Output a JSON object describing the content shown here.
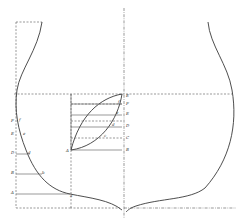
{
  "diagram": {
    "type": "geometric-construction",
    "left_labels": [
      "F",
      "E",
      "D",
      "C",
      "B",
      "A"
    ],
    "left_curve_labels": [
      "f",
      "e",
      "d",
      "c",
      "b",
      "a"
    ],
    "center_right_labels": [
      "F",
      "E",
      "D",
      "C",
      "B",
      "A"
    ],
    "center_curve_labels": [
      "f",
      "e",
      "d",
      "c",
      "b"
    ],
    "center_left_label": "A",
    "centerline_label": "E",
    "colors": {
      "ink": "#3a3a3a",
      "background": "#ffffff"
    }
  }
}
